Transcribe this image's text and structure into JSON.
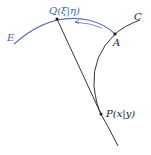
{
  "diagram": {
    "labels": {
      "Q": "Q(ξ|η)",
      "E": "E",
      "C": "C",
      "A": "A",
      "P": "P(x|y)"
    },
    "colors": {
      "evolute": "#5a6fb0",
      "curve": "#333333",
      "label_blue": "#4a5fa8",
      "label_black": "#222222"
    }
  }
}
